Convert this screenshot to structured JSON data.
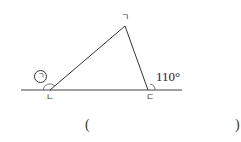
{
  "diagram": {
    "vertices": {
      "top": "ㄱ",
      "bottom_left": "ㄴ",
      "bottom_right": "ㄷ"
    },
    "unknown_angle_label": "ㄱ",
    "given_angle": "110°"
  },
  "answer": {
    "open_paren": "(",
    "close_paren": ")",
    "value": ""
  }
}
